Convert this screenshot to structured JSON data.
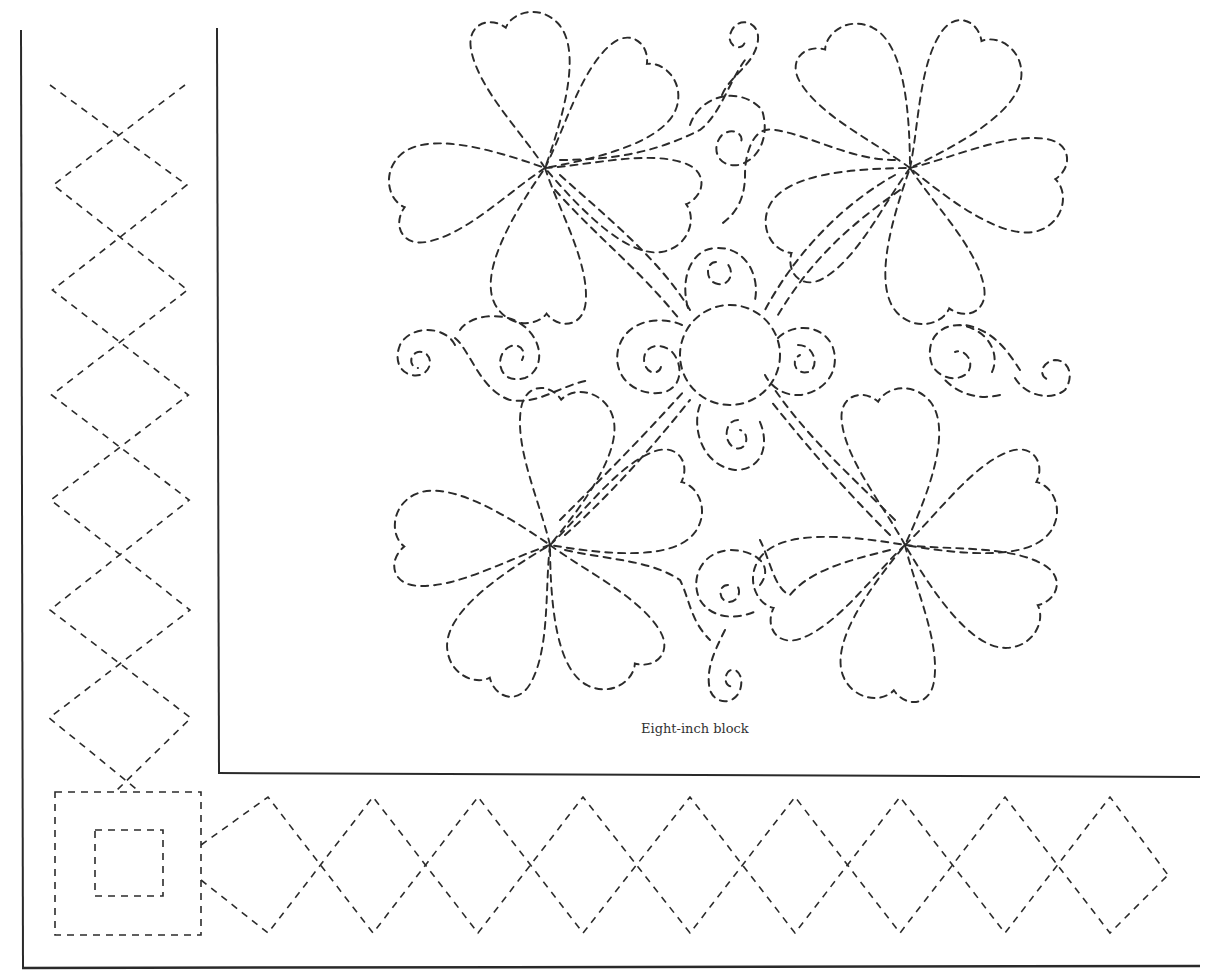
{
  "page": {
    "caption": "Eight-inch block",
    "ink_color": "#2b2b2b",
    "background": "#ffffff"
  },
  "frame": {
    "outer_left_line": {
      "x": 21,
      "y1": 30,
      "y2": 968
    },
    "inner_left_line": {
      "x": 218,
      "y1": 28,
      "y2": 773
    },
    "block_bottom_line": {
      "y": 773,
      "x1": 218,
      "x2": 1200
    },
    "page_bottom_line": {
      "y": 968,
      "x1": 21,
      "x2": 1200
    }
  },
  "left_border": {
    "pattern": "dashed-diamond-chain",
    "diamonds": 6,
    "x_center": 120,
    "half_width": 66,
    "tops": [
      85,
      150,
      250,
      350,
      455,
      565,
      670
    ],
    "start_y": 85,
    "end_y": 790
  },
  "corner_block": {
    "outer_square": {
      "x": 55,
      "y": 792,
      "w": 146,
      "h": 143
    },
    "inner_square": {
      "x": 95,
      "y": 830,
      "w": 68,
      "h": 66
    }
  },
  "bottom_border": {
    "pattern": "dashed-diamond-chain",
    "diamond_centers_x": [
      268,
      373,
      478,
      583,
      690,
      795,
      900,
      1005,
      1110
    ],
    "y_center": 865,
    "half_height": 68,
    "start_x": 200,
    "end_x": 1168
  },
  "block_motif": {
    "center_circle": {
      "cx": 730,
      "cy": 355,
      "r": 50
    },
    "flowers": [
      {
        "name": "top-left",
        "cx": 545,
        "cy": 168
      },
      {
        "name": "top-right",
        "cx": 910,
        "cy": 168
      },
      {
        "name": "bottom-left",
        "cx": 550,
        "cy": 545
      },
      {
        "name": "bottom-right",
        "cx": 905,
        "cy": 545
      }
    ],
    "swirls": [
      {
        "name": "top",
        "cx": 742,
        "cy": 38
      },
      {
        "name": "upper-center",
        "cx": 738,
        "cy": 140
      },
      {
        "name": "ring-top",
        "cx": 718,
        "cy": 280
      },
      {
        "name": "ring-left",
        "cx": 655,
        "cy": 360
      },
      {
        "name": "ring-right",
        "cx": 808,
        "cy": 355
      },
      {
        "name": "ring-bottom",
        "cx": 738,
        "cy": 440
      },
      {
        "name": "left-outer",
        "cx": 413,
        "cy": 352
      },
      {
        "name": "left-inner",
        "cx": 505,
        "cy": 350
      },
      {
        "name": "right-inner",
        "cx": 955,
        "cy": 365
      },
      {
        "name": "right-outer",
        "cx": 1050,
        "cy": 378
      },
      {
        "name": "lower-center",
        "cx": 725,
        "cy": 590
      },
      {
        "name": "bottom",
        "cx": 728,
        "cy": 688
      }
    ]
  }
}
